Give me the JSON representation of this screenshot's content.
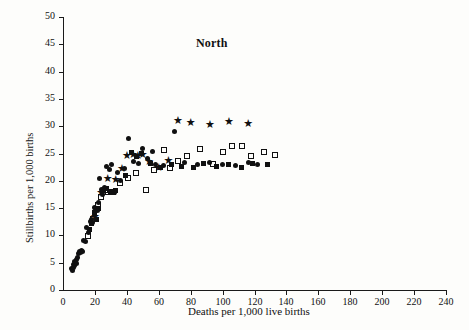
{
  "figure": {
    "title": "North",
    "background_color": "#fdfdfb",
    "ink_color": "#101010"
  },
  "chart_data": {
    "type": "scatter",
    "title": "North",
    "xlabel": "Deaths per 1,000 live births",
    "ylabel": "Stillbirths per 1,000 births",
    "xlim": [
      0,
      240
    ],
    "ylim": [
      0,
      50
    ],
    "xticks": [
      0,
      20,
      40,
      60,
      80,
      100,
      120,
      140,
      160,
      180,
      200,
      220,
      240
    ],
    "yticks": [
      0,
      5,
      10,
      15,
      20,
      25,
      30,
      35,
      40,
      45,
      50
    ],
    "xtick_labels": [
      "0",
      "20",
      "40",
      "60",
      "80",
      "100",
      "120",
      "140",
      "160",
      "180",
      "200",
      "220",
      "240"
    ],
    "ytick_labels": [
      "0",
      "5",
      "10",
      "15",
      "20",
      "25",
      "30",
      "35",
      "40",
      "45",
      "50"
    ],
    "grid": false,
    "legend": "none",
    "series": [
      {
        "name": "filled-circle",
        "marker": "circle",
        "filled": true,
        "points": [
          [
            5.5,
            4.0
          ],
          [
            6.0,
            3.6
          ],
          [
            6.3,
            4.6
          ],
          [
            6.8,
            4.2
          ],
          [
            7.0,
            5.2
          ],
          [
            7.4,
            4.4
          ],
          [
            7.8,
            5.0
          ],
          [
            8.2,
            5.6
          ],
          [
            8.6,
            4.8
          ],
          [
            9.0,
            6.0
          ],
          [
            9.6,
            6.6
          ],
          [
            10.2,
            7.0
          ],
          [
            10.8,
            6.8
          ],
          [
            11.4,
            7.2
          ],
          [
            12.0,
            7.0
          ],
          [
            13.0,
            9.0
          ],
          [
            14.0,
            8.8
          ],
          [
            15.0,
            11.4
          ],
          [
            16.0,
            10.6
          ],
          [
            17.0,
            12.6
          ],
          [
            17.8,
            13.0
          ],
          [
            18.6,
            12.4
          ],
          [
            19.5,
            15.2
          ],
          [
            20.5,
            15.0
          ],
          [
            21.4,
            14.6
          ],
          [
            22.0,
            16.0
          ],
          [
            23.0,
            20.4
          ],
          [
            24.0,
            18.4
          ],
          [
            25.0,
            17.4
          ],
          [
            26.0,
            18.8
          ],
          [
            27.5,
            22.6
          ],
          [
            29.0,
            22.0
          ],
          [
            30.5,
            23.0
          ],
          [
            32.0,
            17.8
          ],
          [
            34.0,
            21.6
          ],
          [
            36.0,
            20.0
          ],
          [
            38.5,
            22.2
          ],
          [
            41.0,
            27.8
          ],
          [
            44.0,
            23.6
          ],
          [
            47.0,
            23.2
          ],
          [
            50.0,
            26.0
          ],
          [
            53.0,
            24.0
          ],
          [
            56.0,
            25.4
          ],
          [
            58.0,
            23.0
          ],
          [
            63.0,
            22.8
          ],
          [
            70.0,
            29.0
          ],
          [
            76.0,
            23.4
          ],
          [
            84.0,
            23.0
          ],
          [
            92.0,
            23.4
          ],
          [
            100.0,
            23.0
          ],
          [
            108.0,
            22.8
          ],
          [
            116.0,
            23.4
          ],
          [
            122.0,
            23.0
          ]
        ]
      },
      {
        "name": "open-square",
        "marker": "square",
        "filled": false,
        "points": [
          [
            15.5,
            9.8
          ],
          [
            19.0,
            13.0
          ],
          [
            22.0,
            15.6
          ],
          [
            24.0,
            17.0
          ],
          [
            26.5,
            18.4
          ],
          [
            28.5,
            18.0
          ],
          [
            31.5,
            18.0
          ],
          [
            36.0,
            19.6
          ],
          [
            41.0,
            20.6
          ],
          [
            46.0,
            21.4
          ],
          [
            52.0,
            18.4
          ],
          [
            57.0,
            22.0
          ],
          [
            63.0,
            25.6
          ],
          [
            67.0,
            22.4
          ],
          [
            72.0,
            23.6
          ],
          [
            78.0,
            24.6
          ],
          [
            86.0,
            25.8
          ],
          [
            94.0,
            23.0
          ],
          [
            100.0,
            25.2
          ],
          [
            106.0,
            26.4
          ],
          [
            112.0,
            26.4
          ],
          [
            118.0,
            24.6
          ],
          [
            126.0,
            25.2
          ],
          [
            133.0,
            24.8
          ]
        ]
      },
      {
        "name": "star",
        "marker": "star",
        "filled": true,
        "points": [
          [
            20.0,
            13.4
          ],
          [
            24.0,
            17.8
          ],
          [
            28.0,
            20.4
          ],
          [
            33.0,
            20.2
          ],
          [
            37.0,
            22.2
          ],
          [
            40.0,
            24.6
          ],
          [
            44.0,
            24.8
          ],
          [
            47.0,
            24.6
          ],
          [
            50.0,
            24.8
          ],
          [
            54.0,
            23.4
          ],
          [
            60.0,
            22.4
          ],
          [
            66.0,
            23.6
          ],
          [
            72.0,
            31.0
          ],
          [
            80.0,
            30.6
          ],
          [
            92.0,
            30.2
          ],
          [
            104.0,
            30.8
          ],
          [
            116.0,
            30.4
          ]
        ]
      }
    ]
  },
  "axes": {
    "origin_px": [
      63,
      290
    ],
    "x_end_px": [
      446,
      290
    ],
    "y_end_px": [
      63,
      17
    ]
  }
}
